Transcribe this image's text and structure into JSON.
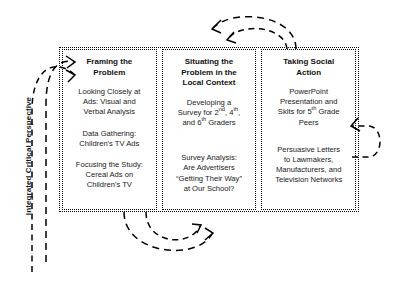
{
  "diagram": {
    "side_label": "Integrated Critical Perspective",
    "columns": [
      {
        "id": "framing-the-problem",
        "title": "Framing the Problem",
        "blocks": [
          "Looking Closely at Ads: Visual and Verbal Analysis",
          "Data Gathering: Children's TV Ads",
          "Focusing the Study: Cereal Ads on Children's TV"
        ]
      },
      {
        "id": "situating-the-problem",
        "title": "Situating the Problem in the Local Context",
        "blocks": [
          "Developing a Survey for 2nd, 4th, and 6th Graders",
          "Survey Analysis: Are Advertisers “Getting Their Way” at Our School?"
        ],
        "blocks_html": [
          "Developing a<br>Survey for 2<sup>nd</sup>, 4<sup>th</sup>,<br>and 6<sup>th</sup> Graders",
          "Survey Analysis:<br>Are Advertisers<br>“Getting Their Way”<br>at Our School?"
        ]
      },
      {
        "id": "taking-social-action",
        "title": "Taking Social Action",
        "blocks": [
          "PowerPoint Presentation and Skits for 5th Grade Peers",
          "Persuasive Letters to Lawmakers, Manufacturers, and Television Networks"
        ],
        "blocks_html": [
          "PowerPoint<br>Presentation and<br>Skits for 5<sup>th</sup> Grade<br>Peers",
          "Persuasive Letters<br>to Lawmakers,<br>Manufacturers, and<br>Television Networks"
        ]
      }
    ],
    "column_titles_html": [
      "Framing the<br>Problem",
      "Situating the<br>Problem in the<br>Local Context",
      "Taking Social<br>Action"
    ],
    "column_1_blocks_html": [
      "Looking Closely at<br>Ads: Visual and<br>Verbal Analysis",
      "Data Gathering:<br>Children's TV Ads",
      "Focusing the Study:<br>Cereal Ads on<br>Children's TV"
    ],
    "arrows": {
      "description": "Nested dashed recursive arrows on all four sides indicating an iterative cyclical process",
      "groups": [
        {
          "name": "top-arc-pair",
          "position": "top-right",
          "direction": "leftward-down"
        },
        {
          "name": "bottom-arc-pair",
          "position": "bottom-center",
          "direction": "upward-left"
        },
        {
          "name": "left-arc-pair",
          "position": "left",
          "direction": "rightward-up"
        },
        {
          "name": "right-arc-loop",
          "position": "right",
          "direction": "upward-left"
        }
      ]
    },
    "colors": {
      "stroke": "#000000",
      "text": "#1a1a1a",
      "background": "#ffffff"
    }
  }
}
